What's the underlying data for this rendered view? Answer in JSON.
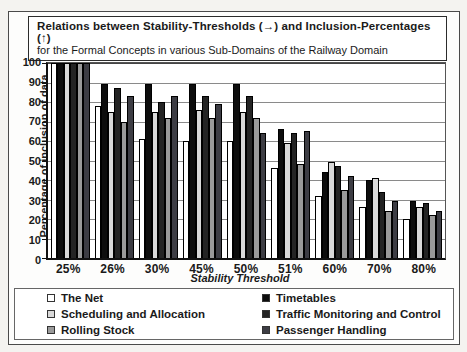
{
  "title": {
    "line1": "Relations between Stability-Thresholds (→) and Inclusion-Percentages (↑)",
    "line2": "for the Formal Concepts in various Sub-Domains of the Railway Domain"
  },
  "chart_data": {
    "type": "bar",
    "title": "Relations between Stability-Thresholds (→) and Inclusion-Percentages (↑) for the Formal Concepts in various Sub-Domains of the Railway Domain",
    "xlabel": "Stability Threshold",
    "ylabel": "Percentage of inclusion of data",
    "ylim": [
      0,
      100
    ],
    "ytick_step": 10,
    "grid": true,
    "legend_position": "bottom",
    "categories": [
      "25%",
      "26%",
      "30%",
      "45%",
      "50%",
      "51%",
      "60%",
      "70%",
      "80%"
    ],
    "series": [
      {
        "name": "The Net",
        "color": "#ffffff",
        "values": [
          100,
          78,
          61,
          60,
          60,
          46,
          32,
          26,
          20
        ]
      },
      {
        "name": "Timetables",
        "color": "#0d0d0d",
        "values": [
          100,
          89,
          89,
          89,
          89,
          66,
          44,
          40,
          29
        ]
      },
      {
        "name": "Scheduling and Allocation",
        "color": "#d9d9d9",
        "values": [
          100,
          75,
          75,
          76,
          75,
          59,
          49,
          41,
          26
        ]
      },
      {
        "name": "Traffic Monitoring and Control",
        "color": "#242424",
        "values": [
          100,
          87,
          80,
          83,
          83,
          64,
          47,
          34,
          28
        ]
      },
      {
        "name": "Rolling Stock",
        "color": "#9a9a9a",
        "values": [
          100,
          70,
          72,
          72,
          72,
          48,
          35,
          24,
          22
        ]
      },
      {
        "name": "Passenger Handling",
        "color": "#3d3d44",
        "values": [
          100,
          83,
          83,
          79,
          64,
          65,
          42,
          29,
          24
        ]
      }
    ]
  }
}
